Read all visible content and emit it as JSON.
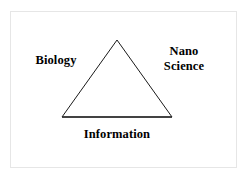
{
  "figure": {
    "background_color": "#ffffff",
    "frame": {
      "name": "outer-frame",
      "border_color": "#e6e6e6",
      "fill_color": "#ffffff"
    },
    "shape": {
      "type": "triangle",
      "stroke_color": "#1a1a1a",
      "fill_color": "none",
      "stroke_width": 1,
      "vertices": {
        "apex": {
          "x": 117,
          "y": 40
        },
        "bottom_left": {
          "x": 62,
          "y": 117
        },
        "bottom_right": {
          "x": 172,
          "y": 117
        }
      }
    },
    "labels": [
      {
        "id": "biology",
        "text": "Biology",
        "position": "left",
        "color": "#000000",
        "bold": true
      },
      {
        "id": "nano_science",
        "text": "Nano\nScience",
        "position": "right",
        "color": "#000000",
        "bold": true
      },
      {
        "id": "information",
        "text": "Information",
        "position": "bottom",
        "color": "#000000",
        "bold": true
      }
    ]
  }
}
